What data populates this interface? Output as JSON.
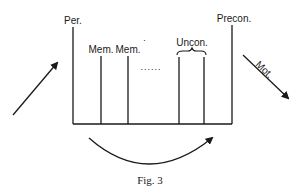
{
  "figure": {
    "caption": "Fig. 3",
    "labels": {
      "per": "Per.",
      "mem1": "Mem.",
      "mem2": "Mem.",
      "mem2_mark": "˙",
      "ellipsis": "......",
      "uncon": "Uncon.",
      "precon": "Precon.",
      "mot": "Mot."
    },
    "colors": {
      "ink": "#1a1a1a",
      "background": "#ffffff"
    },
    "arrows": {
      "incoming": "up-right-arrow",
      "outgoing": "down-right-arrow",
      "curved": "curved-right-arrow"
    }
  }
}
